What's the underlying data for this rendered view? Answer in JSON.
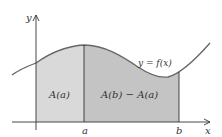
{
  "diagram": {
    "curve_label": "y = f(x)",
    "region_left_label": "A(a)",
    "region_right_label": "A(b) − A(a)",
    "axis_x_label": "x",
    "axis_y_label": "y",
    "tick_a_label": "a",
    "tick_b_label": "b"
  },
  "colors": {
    "region_left_fill": "#d9d9d9",
    "region_right_fill": "#c4c4c4",
    "curve_stroke": "#666666",
    "axis_stroke": "#333333"
  }
}
